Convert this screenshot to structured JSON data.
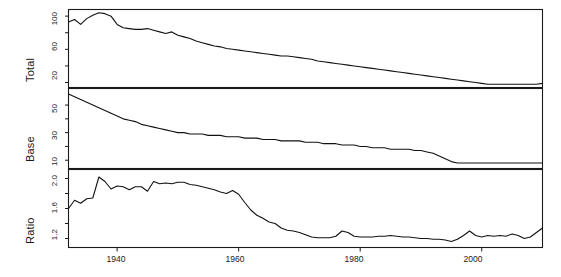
{
  "chart_data": {
    "type": "line",
    "title": "",
    "xlabel": "",
    "grid": false,
    "legend": "none",
    "xlim": [
      1932,
      2010
    ],
    "xticks": [
      1940,
      1960,
      1980,
      2000
    ],
    "xtick_labels": [
      "1940",
      "1960",
      "1980",
      "2000"
    ],
    "panels": [
      {
        "name": "total-panel",
        "ylabel": "Total",
        "ylim": [
          14,
          108
        ],
        "yticks": [
          20,
          40,
          60,
          80,
          100
        ],
        "ytick_labels": [
          "20",
          "",
          "60",
          "",
          "100"
        ],
        "series": [
          {
            "name": "Total",
            "x": [
              1932,
              1933,
              1934,
              1935,
              1936,
              1937,
              1938,
              1939,
              1940,
              1941,
              1942,
              1943,
              1944,
              1945,
              1946,
              1947,
              1948,
              1949,
              1950,
              1951,
              1952,
              1953,
              1954,
              1955,
              1956,
              1957,
              1958,
              1959,
              1960,
              1961,
              1962,
              1963,
              1964,
              1965,
              1966,
              1967,
              1968,
              1969,
              1970,
              1971,
              1972,
              1973,
              1974,
              1975,
              1976,
              1977,
              1978,
              1979,
              1980,
              1981,
              1982,
              1983,
              1984,
              1985,
              1986,
              1987,
              1988,
              1989,
              1990,
              1991,
              1992,
              1993,
              1994,
              1995,
              1996,
              1997,
              1998,
              1999,
              2000,
              2001,
              2002,
              2003,
              2004,
              2005,
              2006,
              2007,
              2008,
              2009,
              2010
            ],
            "values": [
              93,
              96,
              90,
              97,
              101,
              104,
              103,
              100,
              90,
              86,
              85,
              84,
              84,
              85,
              83,
              81,
              79,
              81,
              77,
              75,
              73,
              70,
              68,
              66,
              64,
              63,
              61,
              60,
              59,
              58,
              57,
              56,
              55,
              54,
              53,
              52,
              52,
              51,
              50,
              49,
              48,
              46,
              45,
              44,
              43,
              42,
              41,
              40,
              39,
              38,
              37,
              36,
              35,
              34,
              33,
              32,
              31,
              30,
              29,
              28,
              27,
              26,
              25,
              24,
              23,
              22,
              21,
              20,
              19,
              18,
              18,
              18,
              18,
              18,
              18,
              18,
              18,
              18,
              19
            ]
          }
        ]
      },
      {
        "name": "base-panel",
        "ylabel": "Base",
        "ylim": [
          4,
          62
        ],
        "yticks": [
          10,
          20,
          30,
          40,
          50
        ],
        "ytick_labels": [
          "10",
          "",
          "30",
          "",
          "50"
        ],
        "series": [
          {
            "name": "Base",
            "x": [
              1932,
              1933,
              1934,
              1935,
              1936,
              1937,
              1938,
              1939,
              1940,
              1941,
              1942,
              1943,
              1944,
              1945,
              1946,
              1947,
              1948,
              1949,
              1950,
              1951,
              1952,
              1953,
              1954,
              1955,
              1956,
              1957,
              1958,
              1959,
              1960,
              1961,
              1962,
              1963,
              1964,
              1965,
              1966,
              1967,
              1968,
              1969,
              1970,
              1971,
              1972,
              1973,
              1974,
              1975,
              1976,
              1977,
              1978,
              1979,
              1980,
              1981,
              1982,
              1983,
              1984,
              1985,
              1986,
              1987,
              1988,
              1989,
              1990,
              1991,
              1992,
              1993,
              1994,
              1995,
              1996,
              1997,
              1998,
              1999,
              2000,
              2001,
              2002,
              2003,
              2004,
              2005,
              2006,
              2007,
              2008,
              2009,
              2010
            ],
            "values": [
              58,
              56,
              54,
              52,
              50,
              48,
              46,
              44,
              42,
              40,
              39,
              38,
              36,
              35,
              34,
              33,
              32,
              31,
              30,
              30,
              29,
              29,
              29,
              28,
              28,
              28,
              27,
              27,
              27,
              26,
              26,
              26,
              25,
              25,
              25,
              24,
              24,
              24,
              24,
              23,
              23,
              23,
              22,
              22,
              22,
              21,
              21,
              21,
              20,
              20,
              19,
              19,
              19,
              18,
              18,
              18,
              18,
              17,
              17,
              16,
              15,
              13,
              11,
              9,
              8,
              8,
              8,
              8,
              8,
              8,
              8,
              8,
              8,
              8,
              8,
              8,
              8,
              8,
              8
            ]
          }
        ]
      },
      {
        "name": "ratio-panel",
        "ylabel": "Ratio",
        "ylim": [
          1.08,
          2.12
        ],
        "yticks": [
          1.2,
          1.4,
          1.6,
          1.8,
          2.0
        ],
        "ytick_labels": [
          "1.2",
          "",
          "1.6",
          "",
          "2.0"
        ],
        "series": [
          {
            "name": "Ratio",
            "x": [
              1932,
              1933,
              1934,
              1935,
              1936,
              1937,
              1938,
              1939,
              1940,
              1941,
              1942,
              1943,
              1944,
              1945,
              1946,
              1947,
              1948,
              1949,
              1950,
              1951,
              1952,
              1953,
              1954,
              1955,
              1956,
              1957,
              1958,
              1959,
              1960,
              1961,
              1962,
              1963,
              1964,
              1965,
              1966,
              1967,
              1968,
              1969,
              1970,
              1971,
              1972,
              1973,
              1974,
              1975,
              1976,
              1977,
              1978,
              1979,
              1980,
              1981,
              1982,
              1983,
              1984,
              1985,
              1986,
              1987,
              1988,
              1989,
              1990,
              1991,
              1992,
              1993,
              1994,
              1995,
              1996,
              1997,
              1998,
              1999,
              2000,
              2001,
              2002,
              2003,
              2004,
              2005,
              2006,
              2007,
              2008,
              2009,
              2010
            ],
            "values": [
              1.6,
              1.71,
              1.67,
              1.73,
              1.74,
              2.02,
              1.96,
              1.86,
              1.9,
              1.89,
              1.85,
              1.89,
              1.89,
              1.83,
              1.96,
              1.93,
              1.94,
              1.93,
              1.95,
              1.95,
              1.92,
              1.91,
              1.89,
              1.87,
              1.85,
              1.82,
              1.8,
              1.84,
              1.79,
              1.68,
              1.58,
              1.51,
              1.47,
              1.42,
              1.4,
              1.34,
              1.31,
              1.3,
              1.28,
              1.25,
              1.22,
              1.21,
              1.21,
              1.21,
              1.23,
              1.3,
              1.28,
              1.23,
              1.22,
              1.22,
              1.22,
              1.23,
              1.23,
              1.24,
              1.23,
              1.22,
              1.22,
              1.21,
              1.2,
              1.2,
              1.19,
              1.19,
              1.18,
              1.16,
              1.19,
              1.24,
              1.3,
              1.24,
              1.22,
              1.24,
              1.23,
              1.24,
              1.23,
              1.26,
              1.24,
              1.2,
              1.22,
              1.28,
              1.34
            ]
          }
        ]
      }
    ]
  },
  "colors": {
    "line": "#111111",
    "axis": "#1a1a1a",
    "background": "#ffffff"
  }
}
